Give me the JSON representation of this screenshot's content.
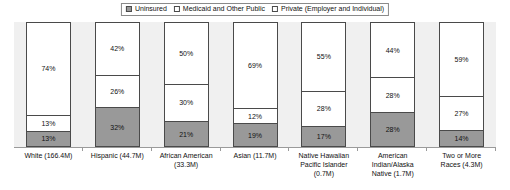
{
  "chart_data": {
    "type": "bar",
    "title": "",
    "subtitle": "",
    "xlabel": "",
    "ylabel": "",
    "ylim": [
      0,
      100
    ],
    "grid": false,
    "stacked": true,
    "stack_mode": "percent",
    "legend_position": "top-center",
    "categories": [
      "White (166.4M)",
      "Hispanic (44.7M)",
      "African American (33.3M)",
      "Asian (11.7M)",
      "Native Hawaiian Pacific Islander (0.7M)",
      "American Indian/Alaska Native (1.7M)",
      "Two or More Races (4.3M)"
    ],
    "category_label_lines": [
      [
        "White (166.4M)"
      ],
      [
        "Hispanic (44.7M)"
      ],
      [
        "African American",
        "(33.3M)"
      ],
      [
        "Asian (11.7M)"
      ],
      [
        "Native Hawaiian",
        "Pacific Islander",
        "(0.7M)"
      ],
      [
        "American",
        "Indian/Alaska",
        "Native (1.7M)"
      ],
      [
        "Two or More",
        "Races (4.3M)"
      ]
    ],
    "series": [
      {
        "name": "Private (Employer and Individual)",
        "key": "private",
        "color": "#ffffff",
        "values": [
          74,
          42,
          50,
          69,
          55,
          44,
          59
        ],
        "labels": [
          "74%",
          "42%",
          "50%",
          "69%",
          "55%",
          "44%",
          "59%"
        ]
      },
      {
        "name": "Medicaid and Other Public",
        "key": "medicaid",
        "color": "#ffffff",
        "values": [
          13,
          26,
          30,
          12,
          28,
          28,
          27
        ],
        "labels": [
          "13%",
          "26%",
          "30%",
          "12%",
          "28%",
          "28%",
          "27%"
        ]
      },
      {
        "name": "Uninsured",
        "key": "uninsured",
        "color": "#999999",
        "values": [
          13,
          32,
          21,
          19,
          17,
          28,
          14
        ],
        "labels": [
          "13%",
          "32%",
          "21%",
          "19%",
          "17%",
          "28%",
          "14%"
        ]
      }
    ]
  },
  "legend": {
    "items": [
      {
        "label": "Uninsured",
        "swatch": "uninsured"
      },
      {
        "label": "Medicaid and Other Public",
        "swatch": "medicaid"
      },
      {
        "label": "Private (Employer and Individual)",
        "swatch": "private"
      }
    ]
  },
  "colors": {
    "uninsured": "#999999",
    "medicaid": "#ffffff",
    "private": "#ffffff",
    "plot_background": "#f0f0f0",
    "bar_outline": "#4a4a4a",
    "axis": "#9a9a9a",
    "text": "#111111"
  }
}
